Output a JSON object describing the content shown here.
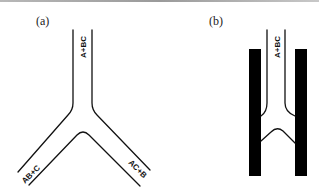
{
  "figure": {
    "panels": [
      {
        "id": "a",
        "label": "(a)",
        "channels": [
          {
            "name": "top",
            "label": "A+BC"
          },
          {
            "name": "lower-left",
            "label": "AB+C"
          },
          {
            "name": "lower-right",
            "label": "AC+B"
          }
        ]
      },
      {
        "id": "b",
        "label": "(b)",
        "channels": [
          {
            "name": "top",
            "label": "A+BC"
          }
        ],
        "walls": [
          "left-black-bar",
          "right-black-bar"
        ]
      }
    ],
    "colors": {
      "line": "#111111",
      "wall": "#000000",
      "background": "#ffffff"
    }
  }
}
